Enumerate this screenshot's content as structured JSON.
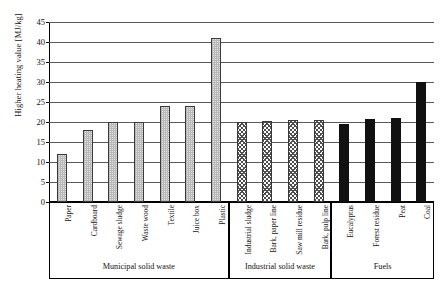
{
  "chart_data": {
    "type": "bar",
    "title": "",
    "xlabel": "",
    "ylabel": "Higher heating value [MJ/kg]",
    "ylim": [
      0,
      45
    ],
    "ytick_step": 5,
    "yticks": [
      0,
      5,
      10,
      15,
      20,
      25,
      30,
      35,
      40,
      45
    ],
    "grid": true,
    "legend": "none",
    "categories": [
      "Paper",
      "Cardboard",
      "Sewage sludge",
      "Waste wood",
      "Textile",
      "Juice box",
      "Plastic",
      "Industrial sludge",
      "Bark, paper line",
      "Saw mill residue",
      "Bark, pulp line",
      "Eucalyptus",
      "Forest residue",
      "Peat",
      "Coal"
    ],
    "values": [
      12,
      18,
      20,
      20,
      24,
      24,
      41,
      20,
      20.3,
      20.5,
      20.5,
      19.5,
      20.7,
      21,
      30
    ],
    "groups": [
      {
        "label": "Municipal solid waste",
        "pattern": "dots",
        "categories": [
          "Paper",
          "Cardboard",
          "Sewage sludge",
          "Waste wood",
          "Textile",
          "Juice box",
          "Plastic"
        ],
        "values": [
          12,
          18,
          20,
          20,
          24,
          24,
          41
        ]
      },
      {
        "label": "Industrial solid waste",
        "pattern": "crosshatch",
        "categories": [
          "Industrial sludge",
          "Bark, paper line",
          "Saw mill residue",
          "Bark, pulp line"
        ],
        "values": [
          20,
          20.3,
          20.5,
          20.5
        ]
      },
      {
        "label": "Fuels",
        "pattern": "solid-black",
        "categories": [
          "Eucalyptus",
          "Forest residue",
          "Peat",
          "Coal"
        ],
        "values": [
          19.5,
          20.7,
          21,
          30
        ]
      }
    ]
  },
  "colors": {
    "axis": "#000000",
    "gridline": "#5a5a5a",
    "bar_dots": "#e3e3e3",
    "bar_crosshatch": "#ffffff",
    "bar_solid": "#111111",
    "background": "#ffffff"
  }
}
